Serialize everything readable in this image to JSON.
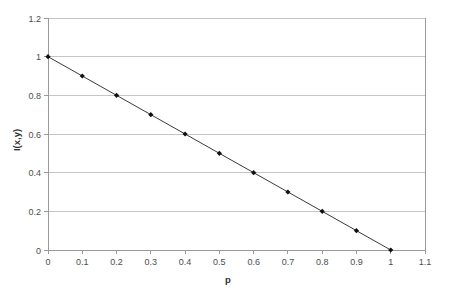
{
  "chart_data": {
    "type": "line",
    "title": "",
    "xlabel": "p",
    "ylabel": "I(x,y)",
    "xlim": [
      0,
      1.1
    ],
    "ylim": [
      0,
      1.2
    ],
    "grid": "horizontal",
    "legend": "none",
    "marker": "filled-diamond",
    "line_color": "#3a3a3a",
    "marker_color": "#111111",
    "gridline_color": "#c6c6c6",
    "axis_color": "#9a9a9a",
    "x": [
      0,
      0.1,
      0.2,
      0.3,
      0.4,
      0.5,
      0.6,
      0.7,
      0.8,
      0.9,
      1
    ],
    "values": [
      1,
      0.9,
      0.8,
      0.7,
      0.6,
      0.5,
      0.4,
      0.3,
      0.2,
      0.1,
      0
    ],
    "series": [
      {
        "name": "I(x,y)",
        "values": [
          1,
          0.9,
          0.8,
          0.7,
          0.6,
          0.5,
          0.4,
          0.3,
          0.2,
          0.1,
          0
        ]
      }
    ],
    "xticks": [
      0,
      0.1,
      0.2,
      0.3,
      0.4,
      0.5,
      0.6,
      0.7,
      0.8,
      0.9,
      1,
      1.1
    ],
    "xticklabels": [
      "0",
      "0.1",
      "0.2",
      "0.3",
      "0.4",
      "0.5",
      "0.6",
      "0.7",
      "0.8",
      "0.9",
      "1",
      "1.1"
    ],
    "yticks": [
      0,
      0.2,
      0.4,
      0.6,
      0.8,
      1,
      1.2
    ],
    "yticklabels": [
      "0",
      "0.2",
      "0.4",
      "0.6",
      "0.8",
      "1",
      "1.2"
    ]
  }
}
